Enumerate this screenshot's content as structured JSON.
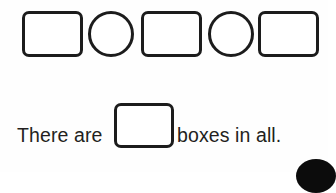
{
  "page": {
    "background_color": "#fefefe",
    "stroke_color": "#1c1c1c",
    "text_color": "#231f20"
  },
  "shape_row": {
    "label": "counting-shapes-row",
    "total_shapes": 5,
    "square_count": 3,
    "circle_count": 2,
    "shapes": [
      {
        "type": "square",
        "name": "square-1",
        "filled": false
      },
      {
        "type": "circle",
        "name": "circle-1",
        "filled": false
      },
      {
        "type": "square",
        "name": "square-2",
        "filled": false
      },
      {
        "type": "circle",
        "name": "circle-2",
        "filled": false
      },
      {
        "type": "square",
        "name": "square-3",
        "filled": false
      }
    ]
  },
  "sentence": {
    "text_before": "There are",
    "text_after": "boxes in all.",
    "answer_box": {
      "value": "",
      "placeholder": ""
    }
  },
  "decoration": {
    "corner_blob": {
      "name": "black-circle-mark",
      "color": "#0c0c0c"
    }
  }
}
